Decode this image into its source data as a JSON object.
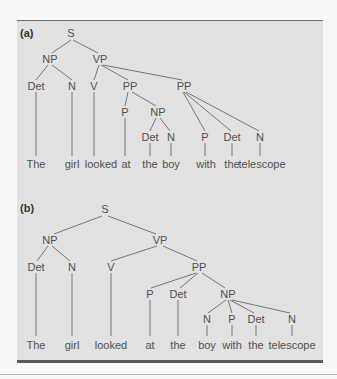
{
  "figure": {
    "panels": [
      {
        "label": "(a)",
        "nodes": {
          "S": "S",
          "NP": "NP",
          "VP": "VP",
          "Det1": "Det",
          "N1": "N",
          "V": "V",
          "PP1": "PP",
          "PP2": "PP",
          "P1": "P",
          "NP2": "NP",
          "Det2": "Det",
          "N2": "N",
          "P2": "P",
          "Det3": "Det",
          "N3": "N"
        },
        "words": [
          "The",
          "girl",
          "looked",
          "at",
          "the",
          "boy",
          "with",
          "the",
          "telescope"
        ]
      },
      {
        "label": "(b)",
        "nodes": {
          "S": "S",
          "NP": "NP",
          "VP": "VP",
          "Det1": "Det",
          "N1": "N",
          "V": "V",
          "PP": "PP",
          "P1": "P",
          "Det2": "Det",
          "NP2": "NP",
          "N2": "N",
          "P2": "P",
          "Det3": "Det",
          "N3": "N"
        },
        "words": [
          "The",
          "girl",
          "looked",
          "at",
          "the",
          "boy",
          "with",
          "the",
          "telescope"
        ]
      }
    ]
  },
  "colors": {
    "panel_bg": "#e1e1e1",
    "text": "#505050",
    "lines": "#6a6a6a",
    "rule": "#5a5a5a"
  }
}
